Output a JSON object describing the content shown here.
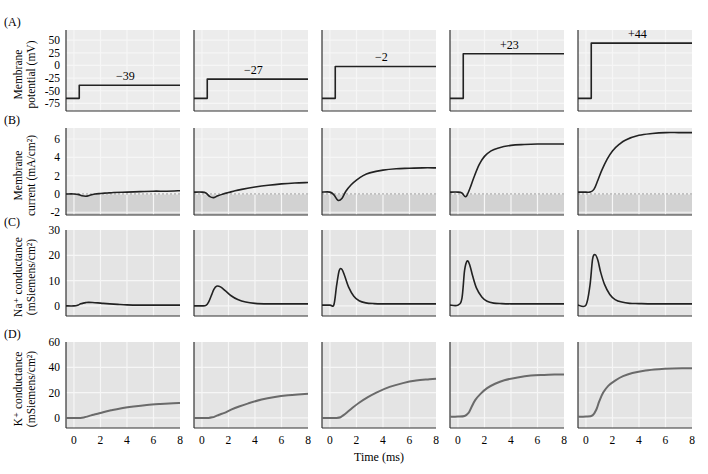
{
  "figure": {
    "time_label": "Time (ms)",
    "x_ticks": [
      0,
      2,
      4,
      6,
      8
    ],
    "x_range": [
      -0.6,
      8
    ],
    "colors": {
      "panel_bg": "#e4e4e4",
      "panel_bg_light": "#ececec",
      "grid": "#f6f6f6",
      "axis": "#333333",
      "trace": "#222222",
      "trace_k": "#6a6a6a",
      "negative_region": "#d2d2d2",
      "zero_dash": "#888888"
    }
  },
  "chart_data": [
    {
      "id": "A",
      "type": "line",
      "panel_label": "(A)",
      "ylabel": [
        "Membrane",
        "potential (mV)"
      ],
      "yticks": [
        50,
        25,
        0,
        -25,
        -50,
        -75
      ],
      "ylim": [
        -90,
        70
      ],
      "xlabel": "",
      "grid": true,
      "series": [
        {
          "name": "step to -39 mV",
          "annotation": "−39",
          "holding": -65,
          "step_time": 0.4,
          "level": -39
        },
        {
          "name": "step to -27 mV",
          "annotation": "−27",
          "holding": -65,
          "step_time": 0.4,
          "level": -27
        },
        {
          "name": "step to -2 mV",
          "annotation": "−2",
          "holding": -65,
          "step_time": 0.4,
          "level": -2
        },
        {
          "name": "step to +23 mV",
          "annotation": "+23",
          "holding": -65,
          "step_time": 0.4,
          "level": 23
        },
        {
          "name": "step to +44 mV",
          "annotation": "+44",
          "holding": -65,
          "step_time": 0.4,
          "level": 44
        }
      ]
    },
    {
      "id": "B",
      "type": "line",
      "panel_label": "(B)",
      "ylabel": [
        "Membrane",
        "current (mA/cm²)"
      ],
      "yticks": [
        6,
        4,
        2,
        0,
        -2
      ],
      "ylim": [
        -2.3,
        7.2
      ],
      "xlabel": "",
      "grid": true,
      "shaded_below_zero": true,
      "x": [
        -0.6,
        0,
        0.3,
        0.6,
        0.9,
        1.2,
        1.6,
        2,
        2.5,
        3,
        4,
        5,
        6,
        7,
        8
      ],
      "series": [
        {
          "name": "-39 mV",
          "values": [
            0,
            0,
            -0.05,
            -0.2,
            -0.25,
            -0.15,
            0,
            0.05,
            0.1,
            0.15,
            0.2,
            0.25,
            0.3,
            0.3,
            0.35
          ]
        },
        {
          "name": "-27 mV",
          "values": [
            0.2,
            0.2,
            0.1,
            -0.3,
            -0.4,
            -0.2,
            0,
            0.15,
            0.35,
            0.5,
            0.75,
            0.95,
            1.1,
            1.2,
            1.25
          ]
        },
        {
          "name": "-2 mV",
          "values": [
            0.2,
            0.2,
            -0.1,
            -0.7,
            -0.5,
            0.3,
            1.0,
            1.5,
            2.0,
            2.3,
            2.6,
            2.75,
            2.8,
            2.85,
            2.85
          ]
        },
        {
          "name": "+23 mV",
          "values": [
            0.2,
            0.2,
            0.1,
            -0.3,
            0.6,
            1.8,
            3.2,
            4.1,
            4.7,
            5.0,
            5.3,
            5.4,
            5.45,
            5.45,
            5.45
          ]
        },
        {
          "name": "+44 mV",
          "values": [
            0.2,
            0.2,
            0.2,
            0.5,
            1.5,
            2.6,
            3.8,
            4.7,
            5.4,
            5.9,
            6.4,
            6.6,
            6.7,
            6.7,
            6.7
          ]
        }
      ]
    },
    {
      "id": "C",
      "type": "line",
      "panel_label": "(C)",
      "ylabel": [
        "Na⁺ conductance",
        "(mSiemens/cm²)"
      ],
      "yticks": [
        30,
        20,
        10,
        0
      ],
      "ylim": [
        -4,
        30
      ],
      "xlabel": "",
      "grid": true,
      "x": [
        -0.6,
        0,
        0.3,
        0.5,
        0.7,
        0.9,
        1.1,
        1.4,
        1.8,
        2.2,
        2.7,
        3.3,
        4,
        5,
        6,
        7,
        8
      ],
      "series": [
        {
          "name": "-39 mV",
          "values": [
            0,
            0,
            0.3,
            0.8,
            1.1,
            1.3,
            1.4,
            1.35,
            1.2,
            1.0,
            0.8,
            0.6,
            0.4,
            0.3,
            0.3,
            0.3,
            0.3
          ]
        },
        {
          "name": "-27 mV",
          "values": [
            0,
            0,
            0.2,
            1.5,
            4.0,
            6.5,
            7.8,
            7.5,
            5.8,
            4.0,
            2.5,
            1.5,
            1.0,
            0.8,
            0.8,
            0.8,
            0.8
          ]
        },
        {
          "name": "-2 mV",
          "values": [
            0.3,
            0.3,
            0.5,
            8.0,
            14.0,
            14.5,
            12.0,
            7.5,
            3.8,
            2.0,
            1.2,
            0.9,
            0.8,
            0.8,
            0.8,
            0.8,
            0.8
          ]
        },
        {
          "name": "+23 mV",
          "values": [
            0.3,
            0.3,
            3.0,
            14.0,
            17.8,
            16.0,
            12.0,
            7.0,
            3.5,
            1.8,
            1.1,
            0.9,
            0.8,
            0.8,
            0.8,
            0.8,
            0.8
          ]
        },
        {
          "name": "+44 mV",
          "values": [
            0.3,
            0.3,
            8.0,
            18.5,
            20.2,
            18.0,
            13.5,
            8.5,
            4.5,
            2.5,
            1.5,
            1.0,
            0.9,
            0.8,
            0.8,
            0.8,
            0.8
          ]
        }
      ]
    },
    {
      "id": "D",
      "type": "line",
      "panel_label": "(D)",
      "ylabel": [
        "K⁺ conductance",
        "(mSiemens/cm²)"
      ],
      "yticks": [
        60,
        40,
        20,
        0
      ],
      "ylim": [
        -8,
        60
      ],
      "xlabel": "Time (ms)",
      "xticks": [
        0,
        2,
        4,
        6,
        8
      ],
      "grid": true,
      "x": [
        -0.6,
        0,
        0.5,
        0.8,
        1.0,
        1.3,
        1.7,
        2.2,
        2.8,
        3.5,
        4.5,
        5.5,
        6.5,
        7.5,
        8
      ],
      "series": [
        {
          "name": "-39 mV",
          "values": [
            0,
            0,
            0,
            0.5,
            1,
            2,
            3,
            4.5,
            6,
            7.5,
            9,
            10.2,
            11,
            11.6,
            11.8
          ]
        },
        {
          "name": "-27 mV",
          "values": [
            0,
            0,
            0,
            0.5,
            1.2,
            2.5,
            4,
            6.5,
            9,
            11.5,
            14.5,
            16.5,
            17.8,
            18.6,
            19
          ]
        },
        {
          "name": "-2 mV",
          "values": [
            0,
            0,
            0,
            0.5,
            2,
            4.5,
            8,
            12,
            16,
            20,
            24.5,
            27.5,
            29.5,
            30.5,
            31
          ]
        },
        {
          "name": "+23 mV",
          "values": [
            1,
            1,
            1.5,
            4,
            8,
            14,
            19,
            23.5,
            27,
            29.8,
            32,
            33.5,
            34,
            34.3,
            34.4
          ]
        },
        {
          "name": "+44 mV",
          "values": [
            1,
            1,
            2,
            7,
            13,
            20,
            25.5,
            29.5,
            33,
            35.5,
            37.5,
            38.5,
            39,
            39.2,
            39.3
          ]
        }
      ]
    }
  ]
}
